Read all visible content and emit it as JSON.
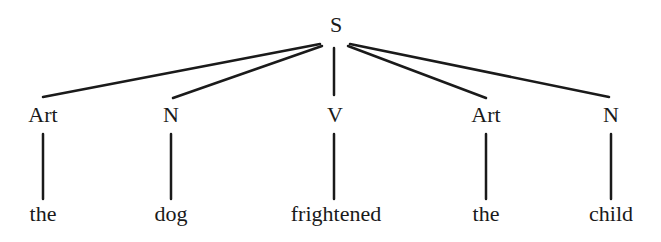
{
  "tree": {
    "root": {
      "label": "S",
      "x": 336,
      "y": 16
    },
    "categories": [
      {
        "label": "Art",
        "x": 43
      },
      {
        "label": "N",
        "x": 171
      },
      {
        "label": "V",
        "x": 336
      },
      {
        "label": "Art",
        "x": 486
      },
      {
        "label": "N",
        "x": 611
      }
    ],
    "words": [
      {
        "label": "the",
        "x": 43
      },
      {
        "label": "dog",
        "x": 171
      },
      {
        "label": "frightened",
        "x": 336
      },
      {
        "label": "the",
        "x": 486
      },
      {
        "label": "child",
        "x": 611
      }
    ],
    "line_color": "#1a1a1a"
  }
}
